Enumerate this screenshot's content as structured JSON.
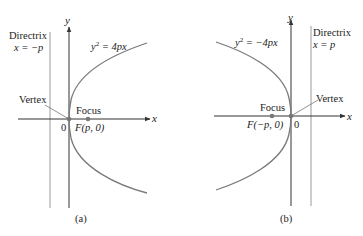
{
  "colors": {
    "axis": "#333333",
    "curve": "#7a7a7a",
    "directrix": "#9a9a9a",
    "point": "#777777",
    "text": "#222222"
  },
  "panels": [
    {
      "id": "a",
      "caption": "(a)",
      "equation_lhs": "y",
      "equation_exp": "2",
      "equation_rhs": " = 4px",
      "directrix_title": "Directrix",
      "directrix_eq": "x = −p",
      "vertex_label": "Vertex",
      "focus_label": "Focus",
      "focus_coord": "F(p, 0)",
      "origin_label": "0",
      "x_axis_label": "x",
      "y_axis_label": "y"
    },
    {
      "id": "b",
      "caption": "(b)",
      "equation_lhs": "y",
      "equation_exp": "2",
      "equation_rhs": " = −4px",
      "directrix_title": "Directrix",
      "directrix_eq": "x = p",
      "vertex_label": "Vertex",
      "focus_label": "Focus",
      "focus_coord": "F(−p, 0)",
      "origin_label": "0",
      "x_axis_label": "x",
      "y_axis_label": "y"
    }
  ]
}
